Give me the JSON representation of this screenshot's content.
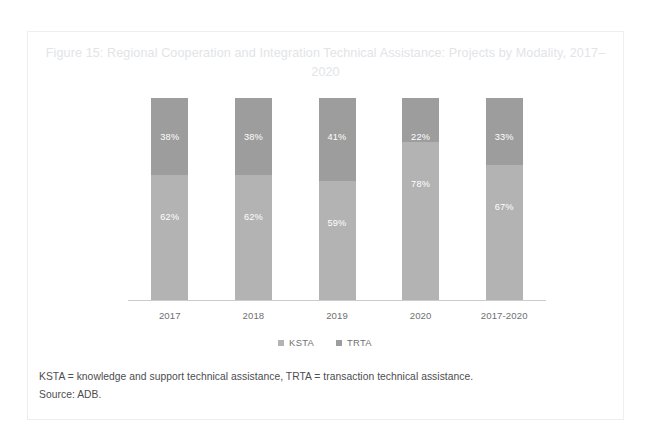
{
  "figure": {
    "title": "Figure 15: Regional Cooperation and Integration Technical Assistance: Projects by Modality, 2017–2020",
    "footnotes": [
      "KSTA = knowledge and support technical assistance, TRTA = transaction technical assistance.",
      "Source: ADB."
    ]
  },
  "colors": {
    "trta": "#9d9d9d",
    "ksta": "#b3b3b3",
    "axis": "#c9cbcd",
    "title_text": "#e2e4e7",
    "tick_text": "#6f7072",
    "footnote_text": "#4c4d4f",
    "frame_border": "#eceef0",
    "label_text": "#ffffff"
  },
  "chart_data": {
    "type": "bar",
    "stacked": true,
    "stacked_mode": "percent",
    "title": "Figure 15: Regional Cooperation and Integration Technical Assistance: Projects by Modality, 2017–2020",
    "xlabel": "",
    "ylabel": "",
    "ylim": [
      0,
      100
    ],
    "grid": false,
    "legend_position": "bottom",
    "categories": [
      "2017",
      "2018",
      "2019",
      "2020",
      "2017-2020"
    ],
    "series": [
      {
        "name": "TRTA",
        "stack_position": "top",
        "values": [
          38,
          38,
          41,
          22,
          33
        ],
        "labels": [
          "38%",
          "38%",
          "41%",
          "22%",
          "33%"
        ]
      },
      {
        "name": "KSTA",
        "stack_position": "bottom",
        "values": [
          62,
          62,
          59,
          78,
          67
        ],
        "labels": [
          "62%",
          "62%",
          "59%",
          "78%",
          "67%"
        ]
      }
    ]
  },
  "legend": {
    "items": [
      {
        "label": "KSTA",
        "color": "#b3b3b3"
      },
      {
        "label": "TRTA",
        "color": "#9d9d9d"
      }
    ]
  }
}
